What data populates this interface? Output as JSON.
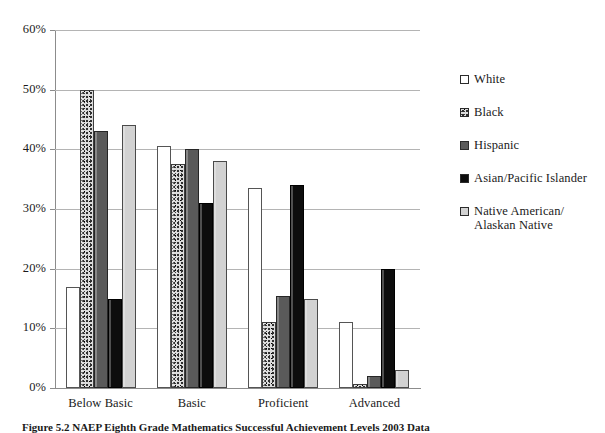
{
  "chart_data": {
    "type": "bar",
    "title": "",
    "xlabel": "",
    "ylabel": "",
    "ylim": [
      0,
      60
    ],
    "ytick_step": 10,
    "grid": true,
    "legend_position": "right",
    "categories": [
      "Below Basic",
      "Basic",
      "Proficient",
      "Advanced"
    ],
    "ytick_labels": [
      "0%",
      "10%",
      "20%",
      "30%",
      "40%",
      "50%",
      "60%"
    ],
    "ytick_values": [
      0,
      10,
      20,
      30,
      40,
      50,
      60
    ],
    "series": [
      {
        "name": "White",
        "swatch": "blank",
        "color": "#ffffff",
        "values": [
          17,
          40.5,
          33.5,
          11
        ]
      },
      {
        "name": "Black",
        "swatch": "speckled",
        "color": "#dcdcdc",
        "values": [
          50,
          37.5,
          11,
          0.7
        ]
      },
      {
        "name": "Hispanic",
        "swatch": "dark-gray",
        "color": "#5a5a5a",
        "values": [
          43,
          40,
          15.5,
          2
        ]
      },
      {
        "name": "Asian/Pacific Islander",
        "swatch": "solid-black",
        "color": "#0d0d0d",
        "values": [
          15,
          31,
          34,
          20
        ]
      },
      {
        "name": "Native American/ Alaskan Native",
        "swatch": "light-gray",
        "color": "#d2d2d2",
        "values": [
          44,
          38,
          15,
          3
        ]
      }
    ]
  },
  "caption": {
    "text": "Figure 5.2    NAEP Eighth Grade Mathematics Successful Achievement Levels 2003 Data"
  }
}
